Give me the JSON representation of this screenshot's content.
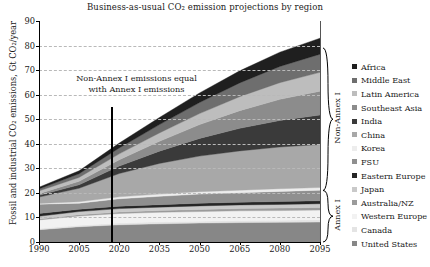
{
  "chart_data": {
    "type": "area",
    "title": "Business-as-usual CO₂ emission projections by region",
    "xlabel": "",
    "ylabel": "Fossil and industrial CO₂ emissions, Gt CO₂/year",
    "xlim": [
      1990,
      2095
    ],
    "ylim": [
      0,
      90
    ],
    "grid": true,
    "legend_position": "right",
    "stacked": true,
    "xticks": [
      "1990",
      "2005",
      "2020",
      "2035",
      "2050",
      "2065",
      "2080",
      "2095"
    ],
    "yticks": [
      "0",
      "10",
      "20",
      "30",
      "40",
      "50",
      "60",
      "70",
      "80",
      "90"
    ],
    "x": [
      1990,
      2005,
      2020,
      2035,
      2050,
      2065,
      2080,
      2095
    ],
    "annotations": [
      {
        "text_line1": "Non-Annex I emissions equal",
        "text_line2": "with Annex I emissions",
        "x": 2017,
        "y_top": 55,
        "y_bottom": 0
      }
    ],
    "group_braces": [
      {
        "label": "Non-Annex I",
        "y_from": 21,
        "y_to": 79
      },
      {
        "label": "Annex I",
        "y_from": 0,
        "y_to": 21
      }
    ],
    "series": [
      {
        "name": "United States",
        "color": "#878787",
        "values": [
          5.0,
          6.2,
          7.0,
          7.4,
          7.7,
          7.9,
          8.0,
          8.1
        ]
      },
      {
        "name": "Canada",
        "color": "#e4e4e4",
        "values": [
          0.5,
          0.6,
          0.7,
          0.8,
          0.8,
          0.9,
          0.9,
          1.0
        ]
      },
      {
        "name": "Western Europe",
        "color": "#f2f2f2",
        "values": [
          3.5,
          3.8,
          3.9,
          3.9,
          3.9,
          3.9,
          3.9,
          3.9
        ]
      },
      {
        "name": "Australia/NZ",
        "color": "#9b9b9b",
        "values": [
          0.4,
          0.5,
          0.6,
          0.7,
          0.8,
          0.9,
          1.0,
          1.1
        ]
      },
      {
        "name": "Japan",
        "color": "#c9c9c9",
        "values": [
          1.1,
          1.3,
          1.4,
          1.4,
          1.5,
          1.5,
          1.5,
          1.5
        ]
      },
      {
        "name": "Eastern Europe",
        "color": "#262626",
        "values": [
          1.1,
          0.9,
          1.0,
          1.0,
          1.1,
          1.1,
          1.2,
          1.2
        ]
      },
      {
        "name": "FSU",
        "color": "#8f8f8f",
        "values": [
          3.8,
          2.5,
          3.0,
          3.4,
          3.7,
          3.9,
          4.1,
          4.3
        ]
      },
      {
        "name": "Korea",
        "color": "#ededed",
        "values": [
          0.3,
          0.6,
          0.8,
          0.9,
          1.0,
          1.0,
          1.1,
          1.1
        ]
      },
      {
        "name": "China",
        "color": "#a8a8a8",
        "values": [
          2.6,
          5.5,
          9.5,
          12.5,
          14.5,
          16.0,
          17.0,
          17.5
        ]
      },
      {
        "name": "India",
        "color": "#3a3a3a",
        "values": [
          0.7,
          1.4,
          3.0,
          5.0,
          7.2,
          9.2,
          10.8,
          12.0
        ]
      },
      {
        "name": "Southeast Asia",
        "color": "#8c8c8c",
        "values": [
          0.7,
          1.4,
          2.6,
          4.0,
          5.6,
          7.2,
          8.6,
          9.7
        ]
      },
      {
        "name": "Latin America",
        "color": "#bdbdbd",
        "values": [
          1.1,
          1.6,
          2.4,
          3.4,
          4.5,
          5.7,
          6.8,
          7.7
        ]
      },
      {
        "name": "Middle East",
        "color": "#6e6e6e",
        "values": [
          0.8,
          1.5,
          2.4,
          3.4,
          4.5,
          5.6,
          6.6,
          7.4
        ]
      },
      {
        "name": "Africa",
        "color": "#1f1f1f",
        "values": [
          0.7,
          1.2,
          2.0,
          2.9,
          3.9,
          4.9,
          5.8,
          6.5
        ]
      }
    ],
    "legend_order": [
      "Africa",
      "Middle East",
      "Latin America",
      "Southeast Asia",
      "India",
      "China",
      "Korea",
      "FSU",
      "Eastern Europe",
      "Japan",
      "Australia/NZ",
      "Western Europe",
      "Canada",
      "United States"
    ]
  }
}
